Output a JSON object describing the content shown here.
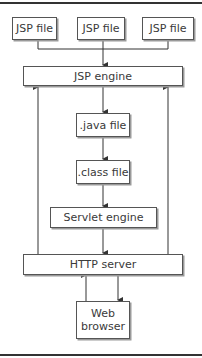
{
  "diagram": {
    "nodes": {
      "jsp_file_1": "JSP file",
      "jsp_file_2": "JSP file",
      "jsp_file_3": "JSP file",
      "jsp_engine": "JSP engine",
      "java_file": ".java file",
      "class_file": ".class file",
      "servlet_engine": "Servlet engine",
      "http_server": "HTTP server",
      "web_browser_line1": "Web",
      "web_browser_line2": "browser"
    },
    "edges": [
      {
        "from": "jsp_file_1",
        "to": "jsp_engine"
      },
      {
        "from": "jsp_file_2",
        "to": "jsp_engine"
      },
      {
        "from": "jsp_file_3",
        "to": "jsp_engine"
      },
      {
        "from": "jsp_engine",
        "to": "java_file"
      },
      {
        "from": "java_file",
        "to": "class_file"
      },
      {
        "from": "class_file",
        "to": "servlet_engine"
      },
      {
        "from": "servlet_engine",
        "to": "http_server"
      },
      {
        "from": "http_server",
        "to": "jsp_engine",
        "side": "left"
      },
      {
        "from": "http_server",
        "to": "jsp_engine",
        "side": "right"
      },
      {
        "from": "web_browser",
        "to": "http_server"
      },
      {
        "from": "http_server",
        "to": "web_browser"
      }
    ],
    "colors": {
      "line": "#333333",
      "box_border": "#555555",
      "shadow": "#9a9a9a",
      "text": "#3a3a3a"
    }
  }
}
